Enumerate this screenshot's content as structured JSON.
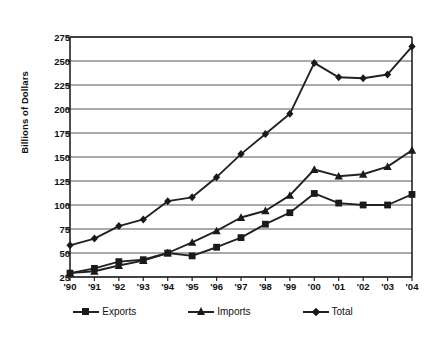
{
  "chart_data": {
    "type": "line",
    "title": "",
    "xlabel": "",
    "ylabel": "Billions of Dollars",
    "x": [
      "'90",
      "'91",
      "'92",
      "'93",
      "'94",
      "'95",
      "'96",
      "'97",
      "'98",
      "'99",
      "'00",
      "'01",
      "'02",
      "'03",
      "'04"
    ],
    "categories": [
      "'90",
      "'91",
      "'92",
      "'93",
      "'94",
      "'95",
      "'96",
      "'97",
      "'98",
      "'99",
      "'00",
      "'01",
      "'02",
      "'03",
      "'04"
    ],
    "ylim": [
      25,
      275
    ],
    "yticks": [
      25,
      50,
      75,
      100,
      125,
      150,
      175,
      200,
      225,
      250,
      275
    ],
    "ytick_labels": [
      "25",
      "50",
      "75",
      "100",
      "125",
      "150",
      "175",
      "200",
      "225",
      "250",
      "275"
    ],
    "grid": "horizontal",
    "legend_position": "bottom",
    "series": [
      {
        "name": "Exports",
        "marker": "square",
        "values": [
          29,
          34,
          41,
          43,
          50,
          47,
          56,
          66,
          80,
          92,
          112,
          102,
          100,
          100,
          111
        ]
      },
      {
        "name": "Imports",
        "marker": "triangle",
        "values": [
          29,
          31,
          37,
          42,
          50,
          61,
          73,
          87,
          94,
          110,
          137,
          130,
          132,
          140,
          157
        ]
      },
      {
        "name": "Total",
        "marker": "diamond",
        "values": [
          58,
          65,
          78,
          85,
          104,
          108,
          129,
          153,
          174,
          195,
          248,
          233,
          232,
          236,
          265
        ]
      }
    ]
  },
  "axis": {
    "y_title": "Billions of Dollars"
  },
  "legend": {
    "items": [
      {
        "label": "Exports",
        "marker": "square-marker-icon"
      },
      {
        "label": "Imports",
        "marker": "triangle-marker-icon"
      },
      {
        "label": "Total",
        "marker": "diamond-marker-icon"
      }
    ]
  },
  "colors": {
    "line": "#222222",
    "marker": "#1a1a1a",
    "grid": "#555555",
    "axis": "#222222",
    "background": "#ffffff"
  }
}
